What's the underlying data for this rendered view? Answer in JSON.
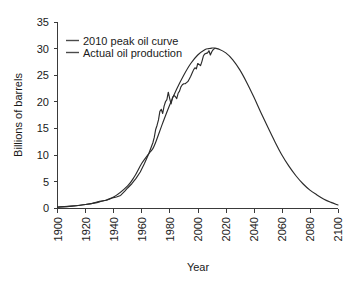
{
  "chart_data": {
    "type": "line",
    "title": "",
    "xlabel": "Year",
    "ylabel": "Billions of barrels",
    "xlim": [
      1900,
      2100
    ],
    "ylim": [
      0,
      35
    ],
    "xticks": [
      "1900",
      "1920",
      "1940",
      "1960",
      "1980",
      "2000",
      "2020",
      "2040",
      "2060",
      "2080",
      "2100"
    ],
    "yticks": [
      "0",
      "5",
      "10",
      "15",
      "20",
      "25",
      "30",
      "35"
    ],
    "grid": false,
    "legend_position": "top-left",
    "series": [
      {
        "name": "2010 peak oil curve",
        "color": "#2b2b2b",
        "x": [
          1900,
          1910,
          1920,
          1930,
          1940,
          1950,
          1955,
          1960,
          1965,
          1968,
          1970,
          1975,
          1980,
          1985,
          1990,
          1995,
          2000,
          2005,
          2008,
          2010,
          2012,
          2015,
          2020,
          2025,
          2030,
          2035,
          2040,
          2045,
          2050,
          2055,
          2060,
          2065,
          2070,
          2075,
          2080,
          2085,
          2090,
          2095,
          2100
        ],
        "values": [
          0.2,
          0.4,
          0.7,
          1.2,
          2.1,
          4.2,
          6.0,
          8.4,
          10.2,
          11.2,
          12.4,
          16.0,
          19.4,
          22.4,
          25.0,
          27.2,
          28.8,
          29.8,
          30.0,
          30.1,
          30.1,
          29.9,
          29.2,
          27.9,
          26.0,
          23.6,
          20.9,
          18.0,
          15.2,
          12.5,
          10.0,
          7.9,
          6.1,
          4.6,
          3.4,
          2.5,
          1.7,
          1.1,
          0.6
        ]
      },
      {
        "name": "Actual oil production",
        "color": "#2b2b2b",
        "x": [
          1900,
          1905,
          1910,
          1915,
          1920,
          1925,
          1930,
          1935,
          1940,
          1942,
          1945,
          1948,
          1950,
          1953,
          1956,
          1959,
          1962,
          1965,
          1967,
          1968,
          1969,
          1970,
          1971,
          1972,
          1973,
          1974,
          1975,
          1976,
          1977,
          1978,
          1979,
          1980,
          1981,
          1982,
          1983,
          1984,
          1985,
          1986,
          1987,
          1988,
          1989,
          1990,
          1991,
          1992,
          1993,
          1994,
          1995,
          1996,
          1997,
          1998,
          1999,
          2000,
          2001,
          2002,
          2003,
          2004,
          2005,
          2006,
          2007,
          2008,
          2009,
          2010,
          2011,
          2012
        ],
        "values": [
          0.2,
          0.3,
          0.4,
          0.5,
          0.7,
          0.9,
          1.3,
          1.5,
          2.0,
          2.1,
          2.4,
          3.2,
          3.8,
          4.6,
          5.6,
          6.8,
          8.4,
          10.2,
          11.6,
          12.3,
          13.3,
          14.8,
          15.6,
          16.6,
          18.2,
          18.6,
          17.8,
          19.2,
          20.0,
          20.4,
          21.8,
          20.6,
          19.6,
          20.8,
          21.2,
          21.0,
          20.6,
          21.6,
          22.0,
          22.8,
          23.2,
          23.4,
          23.4,
          23.6,
          23.8,
          24.3,
          24.8,
          25.4,
          26.0,
          26.4,
          26.2,
          27.2,
          27.0,
          26.8,
          27.6,
          28.6,
          29.0,
          29.1,
          29.2,
          29.6,
          28.8,
          29.4,
          29.8,
          30.0
        ]
      }
    ]
  },
  "legend": {
    "entries": [
      {
        "label": "2010 peak oil curve"
      },
      {
        "label": "Actual oil production"
      }
    ]
  },
  "axes": {
    "x_title": "Year",
    "y_title": "Billions of barrels"
  }
}
